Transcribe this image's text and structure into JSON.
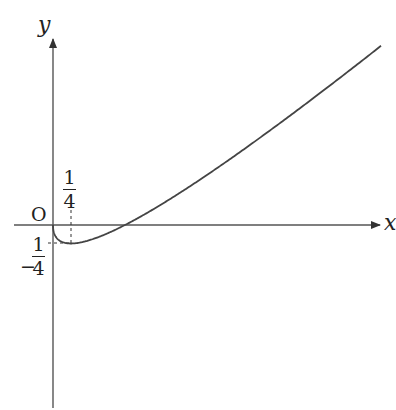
{
  "chart_data": {
    "type": "line",
    "title": "",
    "function": "y = x - sqrt(x)",
    "xlabel": "x",
    "ylabel": "y",
    "origin_label": "O",
    "annotations": [
      {
        "text": "1/4",
        "position": "x-axis tick at minimum",
        "numerator": "1",
        "denominator": "4"
      },
      {
        "text": "-1/4",
        "position": "y-axis tick at minimum",
        "sign": "−",
        "numerator": "1",
        "denominator": "4"
      }
    ],
    "key_points": [
      {
        "x": 0,
        "y": 0,
        "label": "origin"
      },
      {
        "x": 0.25,
        "y": -0.25,
        "label": "minimum"
      },
      {
        "x": 1,
        "y": 0,
        "label": "x-intercept"
      }
    ],
    "x": [
      0,
      0.0625,
      0.25,
      0.5,
      1,
      2,
      3,
      4,
      4.6
    ],
    "values": [
      0,
      -0.1875,
      -0.25,
      -0.207,
      0,
      0.586,
      1.268,
      2,
      2.455
    ],
    "grid": false,
    "legend": null,
    "line_color": "#444444",
    "axis_color": "#555555"
  },
  "labels": {
    "y_axis": "y",
    "x_axis": "x",
    "origin": "O",
    "x_tick_num": "1",
    "x_tick_den": "4",
    "y_tick_sign": "−",
    "y_tick_num": "1",
    "y_tick_den": "4"
  }
}
